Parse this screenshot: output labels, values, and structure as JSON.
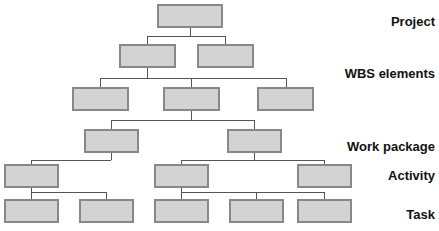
{
  "diagram": {
    "canvas": {
      "width": 439,
      "height": 231
    },
    "style": {
      "box_fill": "#d3d3d3",
      "box_stroke": "#888888",
      "connector_stroke": "#555555",
      "background": "#ffffff",
      "label_color": "#111111"
    },
    "levels": [
      {
        "id": "project",
        "label": "Project",
        "label_x": 435,
        "label_y": 14,
        "boxes": [
          {
            "name": "project-box-1",
            "x": 158,
            "y": 5,
            "w": 64,
            "h": 22
          }
        ]
      },
      {
        "id": "wbs-elements",
        "label": "WBS elements",
        "label_x": 435,
        "label_y": 66,
        "boxes": [
          {
            "name": "wbs-box-1",
            "x": 120,
            "y": 45,
            "w": 55,
            "h": 22
          },
          {
            "name": "wbs-box-2",
            "x": 198,
            "y": 45,
            "w": 55,
            "h": 22
          },
          {
            "name": "wbs-box-3",
            "x": 73,
            "y": 88,
            "w": 55,
            "h": 22
          },
          {
            "name": "wbs-box-4",
            "x": 164,
            "y": 88,
            "w": 55,
            "h": 22
          },
          {
            "name": "wbs-box-5",
            "x": 258,
            "y": 88,
            "w": 55,
            "h": 22
          }
        ]
      },
      {
        "id": "work-package",
        "label": "Work package",
        "label_x": 435,
        "label_y": 139,
        "boxes": [
          {
            "name": "work-package-box-1",
            "x": 85,
            "y": 130,
            "w": 53,
            "h": 22
          },
          {
            "name": "work-package-box-2",
            "x": 228,
            "y": 130,
            "w": 53,
            "h": 22
          }
        ]
      },
      {
        "id": "activity",
        "label": "Activity",
        "label_x": 435,
        "label_y": 168,
        "boxes": [
          {
            "name": "activity-box-1",
            "x": 5,
            "y": 165,
            "w": 53,
            "h": 22
          },
          {
            "name": "activity-box-2",
            "x": 155,
            "y": 165,
            "w": 53,
            "h": 22
          },
          {
            "name": "activity-box-3",
            "x": 298,
            "y": 165,
            "w": 53,
            "h": 22
          }
        ]
      },
      {
        "id": "task",
        "label": "Task",
        "label_x": 435,
        "label_y": 207,
        "boxes": [
          {
            "name": "task-box-1",
            "x": 5,
            "y": 200,
            "w": 53,
            "h": 22
          },
          {
            "name": "task-box-2",
            "x": 80,
            "y": 200,
            "w": 53,
            "h": 22
          },
          {
            "name": "task-box-3",
            "x": 155,
            "y": 200,
            "w": 53,
            "h": 22
          },
          {
            "name": "task-box-4",
            "x": 230,
            "y": 200,
            "w": 53,
            "h": 22
          },
          {
            "name": "task-box-5",
            "x": 298,
            "y": 200,
            "w": 53,
            "h": 22
          }
        ]
      }
    ],
    "connectors": [
      {
        "name": "connector-project-to-wbs",
        "points": "190,27 190,36 147,36 147,45"
      },
      {
        "name": "connector-project-to-wbs-right",
        "points": "190,36 225,36 225,45"
      },
      {
        "name": "connector-wbs1-down",
        "points": "147,67 147,78"
      },
      {
        "name": "connector-wbs-row",
        "points": "100,78 286,78"
      },
      {
        "name": "connector-wbs-child-1",
        "points": "100,78 100,88"
      },
      {
        "name": "connector-wbs-child-2",
        "points": "191,78 191,88"
      },
      {
        "name": "connector-wbs-child-3",
        "points": "286,78 286,88"
      },
      {
        "name": "connector-wbs4-down",
        "points": "191,110 191,120"
      },
      {
        "name": "connector-wp-row",
        "points": "111,120 254,120"
      },
      {
        "name": "connector-wp-child-1",
        "points": "111,120 111,130"
      },
      {
        "name": "connector-wp-child-2",
        "points": "254,120 254,130"
      },
      {
        "name": "connector-wp1-down",
        "points": "111,152 111,160"
      },
      {
        "name": "connector-activity-row-left",
        "points": "31,160 111,160"
      },
      {
        "name": "connector-activity-left-child",
        "points": "31,160 31,165"
      },
      {
        "name": "connector-wp2-down",
        "points": "254,152 254,160"
      },
      {
        "name": "connector-activity-row-right",
        "points": "181,160 324,160"
      },
      {
        "name": "connector-activity-right-child-1",
        "points": "181,160 181,165"
      },
      {
        "name": "connector-activity-right-child-2",
        "points": "324,160 324,165"
      },
      {
        "name": "connector-act1-down",
        "points": "31,187 31,192"
      },
      {
        "name": "connector-task-row-left",
        "points": "31,192 106,192"
      },
      {
        "name": "connector-task-child-1",
        "points": "31,192 31,200"
      },
      {
        "name": "connector-task-child-2",
        "points": "106,192 106,200"
      },
      {
        "name": "connector-act2-down",
        "points": "181,187 181,192"
      },
      {
        "name": "connector-task-row-right",
        "points": "181,192 324,192"
      },
      {
        "name": "connector-task-child-3",
        "points": "181,192 181,200"
      },
      {
        "name": "connector-task-child-4",
        "points": "256,192 256,200"
      },
      {
        "name": "connector-task-child-5",
        "points": "324,192 324,200"
      }
    ]
  }
}
